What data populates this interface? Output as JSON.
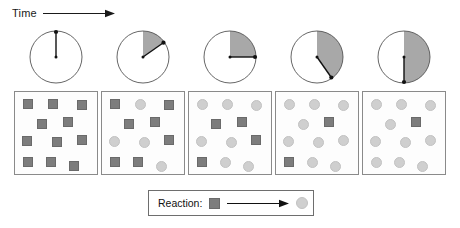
{
  "figure": {
    "title_axis": "Time",
    "axis_arrow_icon": "right-arrow-icon"
  },
  "colors": {
    "reactant_fill": "#7d7d7d",
    "reactant_stroke": "#6a6a6a",
    "product_fill": "#cfcfcf",
    "product_stroke": "#c2c2c2",
    "clock_sector_fill": "#a8a8a8",
    "clock_stroke": "#555555",
    "box_stroke": "#8a8a8a",
    "legend_stroke": "#6e6e6e",
    "text": "#111111"
  },
  "clocks": [
    {
      "name": "clock-1",
      "elapsed_degrees": 0,
      "hand_degrees": 0,
      "sector_shaded": false
    },
    {
      "name": "clock-2",
      "elapsed_degrees": 55,
      "hand_degrees": 55,
      "sector_shaded": true
    },
    {
      "name": "clock-3",
      "elapsed_degrees": 90,
      "hand_degrees": 90,
      "sector_shaded": true
    },
    {
      "name": "clock-4",
      "elapsed_degrees": 145,
      "hand_degrees": 145,
      "sector_shaded": true
    },
    {
      "name": "clock-5",
      "elapsed_degrees": 180,
      "hand_degrees": 180,
      "sector_shaded": true
    }
  ],
  "particle_positions": [
    {
      "x": 8,
      "y": 7
    },
    {
      "x": 33,
      "y": 7
    },
    {
      "x": 62,
      "y": 8
    },
    {
      "x": 22,
      "y": 27
    },
    {
      "x": 48,
      "y": 25
    },
    {
      "x": 7,
      "y": 44
    },
    {
      "x": 37,
      "y": 45
    },
    {
      "x": 62,
      "y": 43
    },
    {
      "x": 8,
      "y": 65
    },
    {
      "x": 31,
      "y": 65
    },
    {
      "x": 54,
      "y": 69
    }
  ],
  "boxes": [
    {
      "name": "box-step-1",
      "squares": 11,
      "circles": 0,
      "species": [
        "square",
        "square",
        "square",
        "square",
        "square",
        "square",
        "square",
        "square",
        "square",
        "square",
        "square"
      ]
    },
    {
      "name": "box-step-2",
      "squares": 7,
      "circles": 4,
      "species": [
        "square",
        "circle",
        "square",
        "square",
        "square",
        "circle",
        "circle",
        "square",
        "square",
        "square",
        "circle"
      ]
    },
    {
      "name": "box-step-3",
      "squares": 4,
      "circles": 7,
      "species": [
        "circle",
        "circle",
        "circle",
        "square",
        "square",
        "circle",
        "circle",
        "square",
        "square",
        "circle",
        "circle"
      ]
    },
    {
      "name": "box-step-4",
      "squares": 2,
      "circles": 9,
      "species": [
        "circle",
        "circle",
        "circle",
        "circle",
        "square",
        "circle",
        "circle",
        "circle",
        "square",
        "circle",
        "circle"
      ]
    },
    {
      "name": "box-step-5",
      "squares": 1,
      "circles": 10,
      "species": [
        "circle",
        "circle",
        "circle",
        "circle",
        "square",
        "circle",
        "circle",
        "circle",
        "circle",
        "circle",
        "circle"
      ]
    }
  ],
  "legend": {
    "label": "Reaction:",
    "reactant_icon": "square-glyph",
    "arrow_icon": "right-arrow-icon",
    "product_icon": "circle-glyph"
  }
}
